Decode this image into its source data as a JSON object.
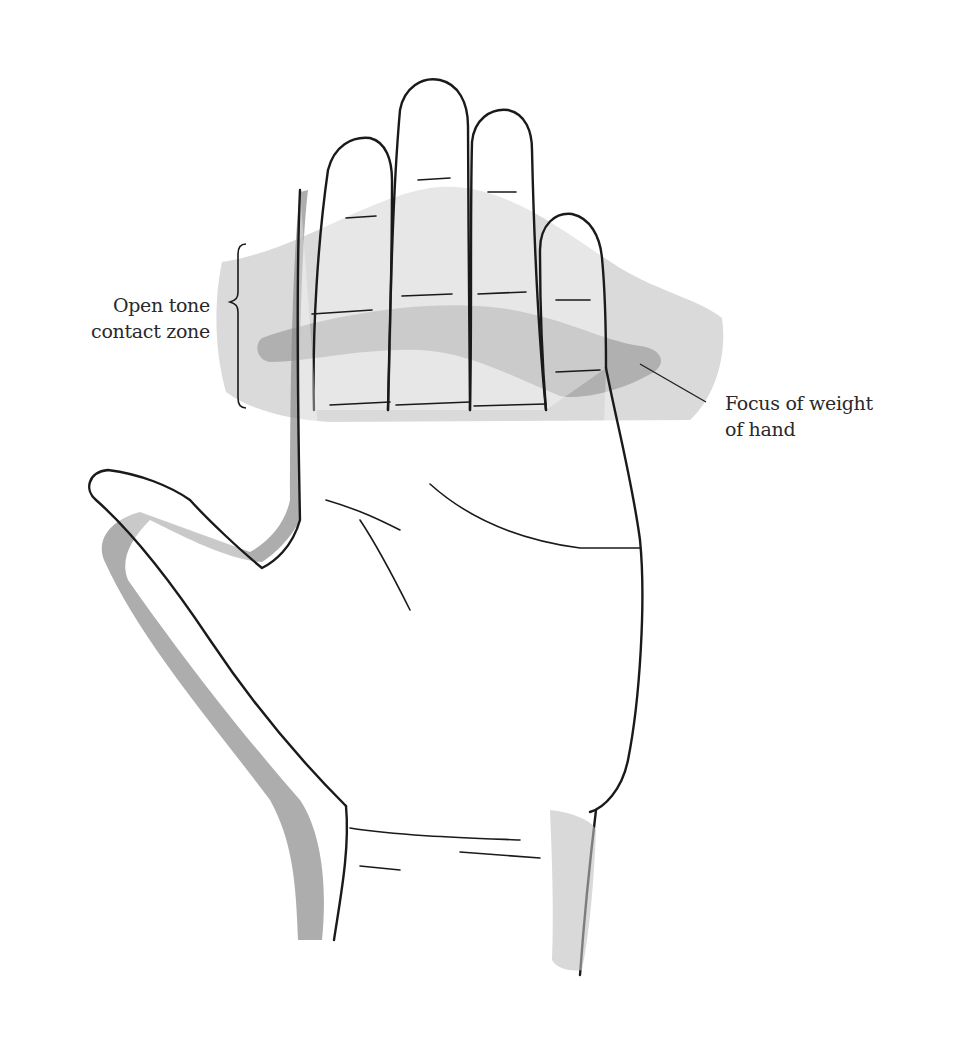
{
  "figure": {
    "labels": {
      "contact_zone": {
        "line1": "Open tone",
        "line2": "contact zone"
      },
      "weight_focus": {
        "line1": "Focus of weight",
        "line2": "of hand"
      }
    },
    "colors": {
      "ink": "#1a1a1a",
      "light_wash": "#d4d4d4",
      "dark_wash": "#a6a6a6",
      "shadow": "#6e6e6e",
      "text": "#2a2a2a"
    }
  }
}
